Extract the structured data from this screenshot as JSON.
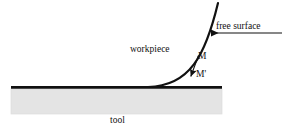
{
  "figure": {
    "type": "technical-diagram",
    "background_color": "#ffffff",
    "line_color": "#111111",
    "tool_fill_color": "#e4e4e4",
    "tool_edge_color": "#d8d8d8"
  },
  "labels": {
    "free_surface": "free surface",
    "workpiece": "workpiece",
    "point_m": "M",
    "point_m_prime": "M'",
    "tool": "tool"
  },
  "elements": {
    "baseline": {
      "name": "tool-top-surface-line",
      "x1": 11,
      "y1": 87,
      "x2": 222,
      "y2": 87,
      "thickness": 2.6
    },
    "tool_block": {
      "name": "tool-body",
      "x": 11,
      "y": 89,
      "width": 211,
      "height": 25
    },
    "workpiece_curve": {
      "name": "workpiece-free-surface-curve",
      "start": [
        148,
        87
      ],
      "control_1": [
        190,
        86
      ],
      "control_2": [
        205,
        55
      ],
      "end": [
        218,
        3
      ],
      "thickness": 2.2
    },
    "free_surface_leader": {
      "name": "free-surface-leader-line",
      "from": [
        282,
        33
      ],
      "to": [
        209,
        33
      ],
      "arrow": "left"
    },
    "m_to_mprime_arrow": {
      "name": "displacement-vector-arrow",
      "from": [
        198,
        56
      ],
      "to": [
        190,
        78
      ],
      "arrow": "down-left"
    }
  },
  "annotation_positions": {
    "free_surface": [
      216,
      22
    ],
    "workpiece": [
      130,
      45
    ],
    "point_m": [
      198,
      52
    ],
    "point_m_prime": [
      196,
      70
    ],
    "tool": [
      110,
      116
    ]
  }
}
